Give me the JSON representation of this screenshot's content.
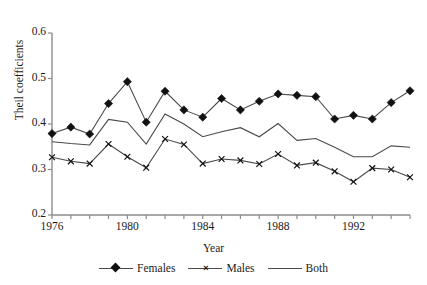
{
  "cut_caption": "",
  "axes": {
    "ylabel": "Theil coefficients",
    "xlabel": "Year",
    "yticks": [
      "0.6",
      "0.5",
      "0.4",
      "0.3",
      "0.2"
    ],
    "xticks": [
      "1976",
      "1980",
      "1984",
      "1988",
      "1992"
    ]
  },
  "legend": {
    "items": [
      {
        "label": "Females",
        "marker": "diamond-marker",
        "glyph": "",
        "color": "#111111"
      },
      {
        "label": "Males",
        "marker": "x-marker",
        "glyph": "×",
        "color": "#111111"
      },
      {
        "label": "Both",
        "marker": "line-only",
        "glyph": "",
        "color": "#4a4a4a"
      }
    ]
  },
  "chart_data": {
    "type": "line",
    "title": "",
    "xlabel": "Year",
    "ylabel": "Theil coefficients",
    "xlim": [
      1976,
      1995
    ],
    "ylim": [
      0.2,
      0.6
    ],
    "ytick_values": [
      0.2,
      0.3,
      0.4,
      0.5,
      0.6
    ],
    "xtick_values": [
      1976,
      1980,
      1984,
      1988,
      1992
    ],
    "grid": false,
    "legend_position": "bottom",
    "x": [
      1976,
      1977,
      1978,
      1979,
      1980,
      1981,
      1982,
      1983,
      1984,
      1985,
      1986,
      1987,
      1988,
      1989,
      1990,
      1991,
      1992,
      1993,
      1994,
      1995
    ],
    "series": [
      {
        "name": "Females",
        "marker": "diamond",
        "values": [
          0.379,
          0.393,
          0.378,
          0.445,
          0.493,
          0.404,
          0.472,
          0.431,
          0.415,
          0.456,
          0.431,
          0.45,
          0.466,
          0.463,
          0.46,
          0.411,
          0.419,
          0.411,
          0.447,
          0.473
        ]
      },
      {
        "name": "Males",
        "marker": "x",
        "values": [
          0.327,
          0.318,
          0.313,
          0.356,
          0.328,
          0.304,
          0.367,
          0.355,
          0.313,
          0.323,
          0.32,
          0.312,
          0.334,
          0.309,
          0.315,
          0.296,
          0.273,
          0.303,
          0.3,
          0.283
        ]
      },
      {
        "name": "Both",
        "marker": "none",
        "values": [
          0.361,
          0.357,
          0.354,
          0.41,
          0.404,
          0.356,
          0.422,
          0.4,
          0.372,
          0.383,
          0.392,
          0.372,
          0.401,
          0.364,
          0.368,
          0.349,
          0.328,
          0.328,
          0.352,
          0.349
        ]
      }
    ]
  }
}
